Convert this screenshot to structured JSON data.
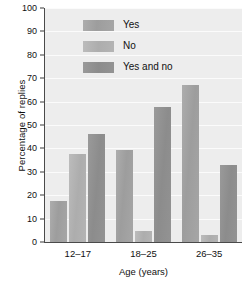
{
  "chart_data": {
    "type": "bar",
    "title": "",
    "xlabel": "Age (years)",
    "ylabel": "Percentage of replies",
    "categories": [
      "12–17",
      "18–25",
      "26–35"
    ],
    "series": [
      {
        "name": "Yes",
        "values": [
          17.5,
          39.5,
          67.0
        ],
        "color": "#9d9d9d"
      },
      {
        "name": "No",
        "values": [
          37.5,
          4.5,
          3.0
        ],
        "color": "#adadad"
      },
      {
        "name": "Yes and no",
        "values": [
          46.0,
          57.5,
          33.0
        ],
        "color": "#8c8c8c"
      }
    ],
    "ylim": [
      0,
      100
    ],
    "yticks": [
      0,
      10,
      20,
      30,
      40,
      50,
      60,
      70,
      80,
      90,
      100
    ],
    "ytick_labels": [
      "0",
      "10",
      "20",
      "30",
      "40",
      "50",
      "60",
      "70",
      "80",
      "90",
      "100"
    ],
    "grid": true,
    "grid_axis": "y",
    "legend_position": "upper-left-inside",
    "plot_background": "#ededed",
    "grid_color": "#fbfbfb",
    "axis_color": "#4a4a4a"
  }
}
